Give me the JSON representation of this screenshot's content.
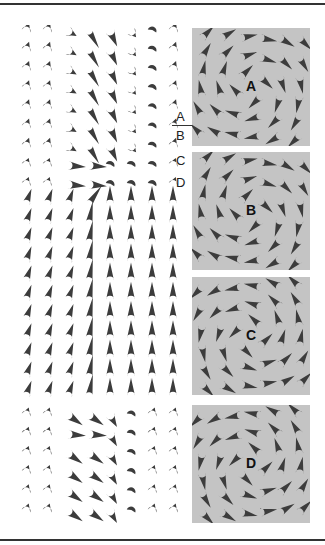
{
  "figure": {
    "side_labels": [
      "A",
      "B",
      "C",
      "D"
    ],
    "panels": [
      {
        "label": "A",
        "top": 28,
        "height": 118,
        "sense": 1,
        "cone_style": "flat"
      },
      {
        "label": "B",
        "top": 152,
        "height": 118,
        "sense": 1,
        "cone_style": "flat"
      },
      {
        "label": "C",
        "top": 277,
        "height": 118,
        "sense": -1,
        "cone_style": "flat"
      },
      {
        "label": "D",
        "top": 405,
        "height": 118,
        "sense": -1,
        "cone_style": "rounded"
      }
    ],
    "field": {
      "columns": 8,
      "rows": 26
    },
    "colors": {
      "panel_bg": "#c4c4c4",
      "cone": "#3c3c3c",
      "rule": "#333333"
    }
  }
}
